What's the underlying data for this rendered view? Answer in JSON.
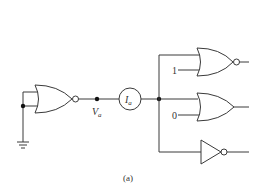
{
  "figure": {
    "caption": "(a)",
    "labels": {
      "voltage_node": "V",
      "voltage_sub": "a",
      "current_meter": "I",
      "current_sub": "a",
      "nor_top_input": "1",
      "or_input": "0"
    },
    "components": [
      {
        "type": "NOR",
        "role": "driver",
        "inputs": "both tied to ground"
      },
      {
        "type": "ammeter",
        "label": "I_a"
      },
      {
        "type": "NOR",
        "role": "load",
        "second_input": "1"
      },
      {
        "type": "OR",
        "role": "load",
        "second_input": "0"
      },
      {
        "type": "NOT",
        "role": "load"
      }
    ],
    "colors": {
      "line": "#3a3a3a",
      "background": "#ffffff"
    }
  }
}
